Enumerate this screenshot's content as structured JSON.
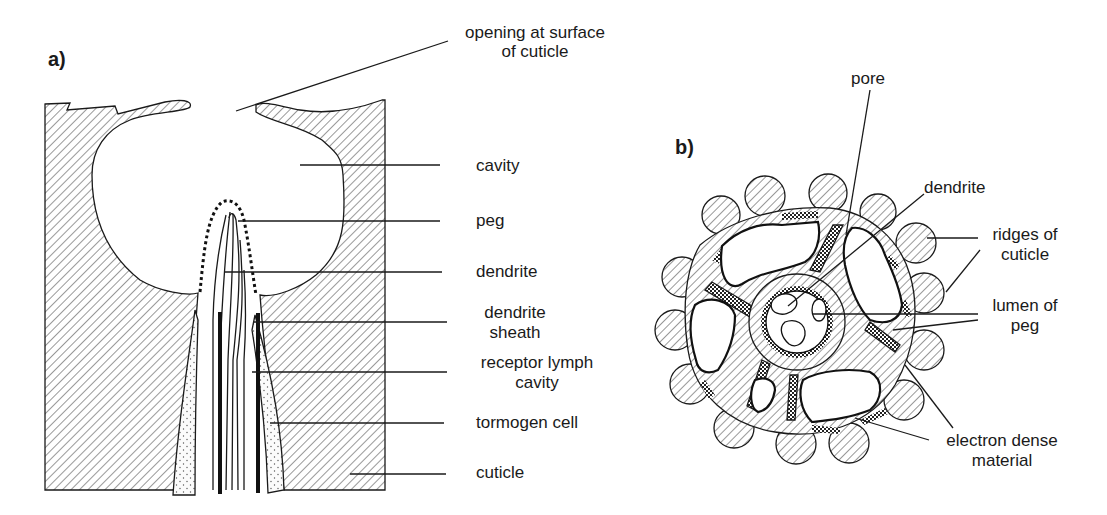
{
  "figure": {
    "panel_a": {
      "label": "a)",
      "title": "Longitudinal section of sensillum peg in cuticle pit",
      "labels": {
        "opening_line1": "opening at surface",
        "opening_line2": "of cuticle",
        "cavity": "cavity",
        "peg": "peg",
        "dendrite": "dendrite",
        "sheath_line1": "dendrite",
        "sheath_line2": "sheath",
        "lymph_line1": "receptor lymph",
        "lymph_line2": "cavity",
        "tormogen": "tormogen cell",
        "cuticle": "cuticle"
      }
    },
    "panel_b": {
      "label": "b)",
      "title": "Cross section of peg",
      "labels": {
        "pore": "pore",
        "dendrite": "dendrite",
        "ridges_line1": "ridges of",
        "ridges_line2": "cuticle",
        "lumen_line1": "lumen of",
        "lumen_line2": "peg",
        "edm_line1": "electron dense",
        "edm_line2": "material"
      }
    },
    "colors": {
      "ink": "#1a1a1a",
      "background": "#ffffff"
    }
  }
}
